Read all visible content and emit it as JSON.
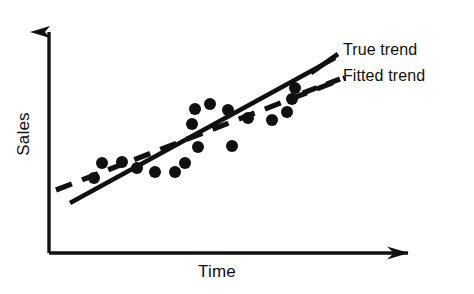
{
  "figure": {
    "width": 474,
    "height": 294,
    "background": "#ffffff",
    "ink_color": "#101010"
  },
  "axes": {
    "origin": {
      "x": 49,
      "y": 253
    },
    "y_axis_top": {
      "x": 49,
      "y": 20
    },
    "x_axis_right": {
      "x": 426,
      "y": 253
    },
    "y_label": "Sales",
    "x_label": "Time",
    "arrowheads": true,
    "ticks": false,
    "grid": false
  },
  "legend": {
    "position": "top-right",
    "entries": [
      {
        "label": "True trend",
        "style": "solid"
      },
      {
        "label": "Fitted trend",
        "style": "dashed"
      }
    ]
  },
  "chart_data": {
    "type": "scatter",
    "title": "",
    "xlabel": "Time",
    "ylabel": "Sales",
    "xlim": [
      0,
      1
    ],
    "ylim": [
      0,
      1
    ],
    "grid": false,
    "axis_ticks": false,
    "legend_position": "top-right",
    "annotations": [
      "True trend",
      "Fitted trend"
    ],
    "points": [
      {
        "x": 94,
        "y": 178
      },
      {
        "x": 102,
        "y": 163
      },
      {
        "x": 122,
        "y": 162
      },
      {
        "x": 137,
        "y": 168
      },
      {
        "x": 155,
        "y": 172
      },
      {
        "x": 175,
        "y": 172
      },
      {
        "x": 185,
        "y": 163
      },
      {
        "x": 192,
        "y": 124
      },
      {
        "x": 195,
        "y": 109
      },
      {
        "x": 198,
        "y": 147
      },
      {
        "x": 210,
        "y": 104
      },
      {
        "x": 228,
        "y": 110
      },
      {
        "x": 232,
        "y": 146
      },
      {
        "x": 248,
        "y": 118
      },
      {
        "x": 272,
        "y": 120
      },
      {
        "x": 287,
        "y": 112
      },
      {
        "x": 292,
        "y": 99
      },
      {
        "x": 295,
        "y": 88
      }
    ],
    "point_radius": 6,
    "series": [
      {
        "name": "True trend",
        "style": "solid",
        "x": [
          70,
          335
        ],
        "y": [
          203,
          58
        ]
      },
      {
        "name": "Fitted trend",
        "style": "dashed",
        "x": [
          56,
          345
        ],
        "y": [
          190,
          78
        ]
      }
    ]
  }
}
